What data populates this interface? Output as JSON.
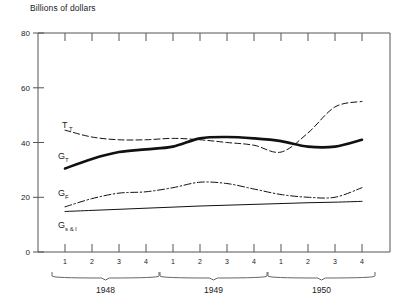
{
  "chart_data": {
    "type": "line",
    "title": "",
    "ylabel": "Billions of dollars",
    "xlabel": "",
    "ylim": [
      0,
      80
    ],
    "yticks": [
      0,
      20,
      40,
      60,
      80
    ],
    "grid": false,
    "legend": "inline-labels",
    "x": [
      "1948 1",
      "1948 2",
      "1948 3",
      "1948 4",
      "1949 1",
      "1949 2",
      "1949 3",
      "1949 4",
      "1950 1",
      "1950 2",
      "1950 3",
      "1950 4"
    ],
    "quarter_labels": [
      "1",
      "2",
      "3",
      "4",
      "1",
      "2",
      "3",
      "4",
      "1",
      "2",
      "3",
      "4"
    ],
    "year_groups": [
      {
        "label": "1948",
        "quarters": [
          "1",
          "2",
          "3",
          "4"
        ]
      },
      {
        "label": "1949",
        "quarters": [
          "1",
          "2",
          "3",
          "4"
        ]
      },
      {
        "label": "1950",
        "quarters": [
          "1",
          "2",
          "3",
          "4"
        ]
      }
    ],
    "series": [
      {
        "name": "T_T",
        "label": "T",
        "sublabel": "T",
        "style": "dashed",
        "width": 1,
        "values": [
          44.5,
          42.0,
          41.0,
          41.0,
          41.5,
          41.0,
          40.0,
          39.0,
          36.5,
          43.5,
          53.0,
          55.0
        ]
      },
      {
        "name": "G_T",
        "label": "G",
        "sublabel": "T",
        "style": "solid-thick",
        "width": 2.6,
        "values": [
          30.5,
          34.0,
          36.5,
          37.5,
          38.5,
          41.5,
          42.0,
          41.5,
          40.5,
          38.5,
          38.5,
          41.0
        ]
      },
      {
        "name": "G_F",
        "label": "G",
        "sublabel": "F",
        "style": "dash-dot",
        "width": 1,
        "values": [
          16.5,
          19.5,
          21.5,
          22.0,
          23.5,
          25.5,
          25.0,
          23.0,
          21.0,
          20.0,
          20.0,
          23.5
        ]
      },
      {
        "name": "G_s&l",
        "label": "G",
        "sublabel": "s & l",
        "style": "solid-thin",
        "width": 1,
        "values": [
          14.8,
          15.2,
          15.6,
          16.0,
          16.4,
          16.8,
          17.1,
          17.4,
          17.7,
          18.0,
          18.2,
          18.5
        ]
      }
    ]
  },
  "labels": {
    "tt": "T",
    "tt_sub": "T",
    "gt": "G",
    "gt_sub": "T",
    "gf": "G",
    "gf_sub": "F",
    "gsl": "G",
    "gsl_sub": "s & l"
  }
}
